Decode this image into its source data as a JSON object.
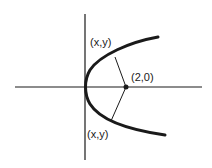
{
  "diagram": {
    "type": "parabola-focus",
    "colors": {
      "ink": "#1a1a1a",
      "background": "#ffffff"
    },
    "labels": {
      "upper_point": "(x,y)",
      "focus": "(2,0)",
      "lower_point": "(x,y)"
    },
    "focus": {
      "x": 2,
      "y": 0
    },
    "vertex": {
      "x": 0,
      "y": 0
    }
  }
}
